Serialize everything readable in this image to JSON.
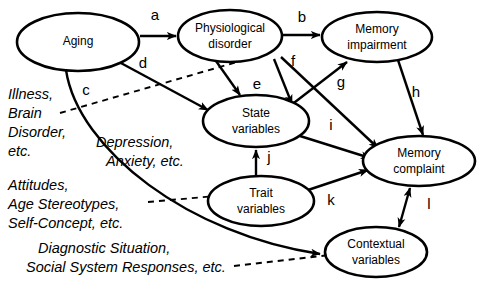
{
  "figure": {
    "type": "path-model-diagram",
    "background_color": "#ffffff",
    "line_color": "#000000"
  },
  "nodes": [
    {
      "id": "aging",
      "label_line1": "Aging",
      "label_line2": "",
      "cx": 78,
      "cy": 42,
      "rx": 61,
      "ry": 29
    },
    {
      "id": "physio",
      "label_line1": "Physiological",
      "label_line2": "disorder",
      "cx": 230,
      "cy": 36,
      "rx": 52,
      "ry": 26
    },
    {
      "id": "memimp",
      "label_line1": "Memory",
      "label_line2": "impairment",
      "cx": 377,
      "cy": 37,
      "rx": 55,
      "ry": 25
    },
    {
      "id": "statevar",
      "label_line1": "State",
      "label_line2": "variables",
      "cx": 256,
      "cy": 121,
      "rx": 53,
      "ry": 26
    },
    {
      "id": "memcomp",
      "label_line1": "Memory",
      "label_line2": "complaint",
      "cx": 419,
      "cy": 161,
      "rx": 56,
      "ry": 25
    },
    {
      "id": "traitvar",
      "label_line1": "Trait",
      "label_line2": "variables",
      "cx": 261,
      "cy": 201,
      "rx": 53,
      "ry": 25
    },
    {
      "id": "contextvar",
      "label_line1": "Contextual",
      "label_line2": "variables",
      "cx": 376,
      "cy": 252,
      "rx": 51,
      "ry": 25
    }
  ],
  "edges": [
    {
      "id": "a",
      "label": "a",
      "from": "aging",
      "to": "physio",
      "style": "solid",
      "arrows": "single",
      "label_x": 155,
      "label_y": 16
    },
    {
      "id": "b",
      "label": "b",
      "from": "physio",
      "to": "memimp",
      "style": "solid",
      "arrows": "single",
      "label_x": 302,
      "label_y": 18
    },
    {
      "id": "c",
      "label": "c",
      "from": "aging",
      "to": "contextvar",
      "style": "solid",
      "arrows": "single",
      "label_x": 86,
      "label_y": 91
    },
    {
      "id": "d",
      "label": "d",
      "from": "aging",
      "to": "statevar",
      "style": "solid",
      "arrows": "single",
      "label_x": 143,
      "label_y": 64
    },
    {
      "id": "e",
      "label": "e",
      "from": "physio",
      "to": "statevar",
      "style": "solid",
      "arrows": "single",
      "label_x": 257,
      "label_y": 85
    },
    {
      "id": "f",
      "label": "f",
      "from": "physio",
      "to": "statevar",
      "style": "solid",
      "arrows": "single",
      "label_x": 293,
      "label_y": 62
    },
    {
      "id": "g",
      "label": "g",
      "from": "statevar",
      "to": "memimp",
      "style": "solid",
      "arrows": "single",
      "label_x": 341,
      "label_y": 83
    },
    {
      "id": "h",
      "label": "h",
      "from": "memimp",
      "to": "memcomp",
      "style": "solid",
      "arrows": "single",
      "label_x": 416,
      "label_y": 93
    },
    {
      "id": "i",
      "label": "i",
      "from": "statevar",
      "to": "memcomp",
      "style": "solid",
      "arrows": "single",
      "label_x": 331,
      "label_y": 126
    },
    {
      "id": "j",
      "label": "j",
      "from": "traitvar",
      "to": "statevar",
      "style": "solid",
      "arrows": "single",
      "label_x": 269,
      "label_y": 158
    },
    {
      "id": "k",
      "label": "k",
      "from": "traitvar",
      "to": "memcomp",
      "style": "solid",
      "arrows": "single",
      "label_x": 331,
      "label_y": 201
    },
    {
      "id": "l",
      "label": "l",
      "from": "memcomp",
      "to": "contextvar",
      "style": "solid",
      "arrows": "double",
      "label_x": 429,
      "label_y": 205
    },
    {
      "id": "physio-memcomp",
      "label": "",
      "from": "physio",
      "to": "memcomp",
      "style": "solid",
      "arrows": "single",
      "label_x": 0,
      "label_y": 0
    }
  ],
  "annotations": [
    {
      "id": "illness",
      "lines": [
        "Illness,",
        "Brain",
        "Disorder,",
        "etc."
      ],
      "x": 8,
      "y": 95,
      "line_height": 19,
      "leader": "dashed",
      "leader_target": "d-edge"
    },
    {
      "id": "depression",
      "lines": [
        "Depression,",
        "Anxiety, etc."
      ],
      "x": 96,
      "y": 143,
      "line_height": 19,
      "leader": "none",
      "leader_target": "statevar"
    },
    {
      "id": "attitudes",
      "lines": [
        "Attitudes,",
        "Age Stereotypes,",
        "Self-Concept, etc."
      ],
      "x": 8,
      "y": 186,
      "line_height": 19,
      "leader": "dashed",
      "leader_target": "traitvar"
    },
    {
      "id": "diagnostic",
      "lines": [
        "Diagnostic Situation,",
        "Social System Responses, etc."
      ],
      "x": 38,
      "y": 249,
      "line_height": 19,
      "leader": "dashed",
      "leader_target": "contextvar"
    }
  ]
}
